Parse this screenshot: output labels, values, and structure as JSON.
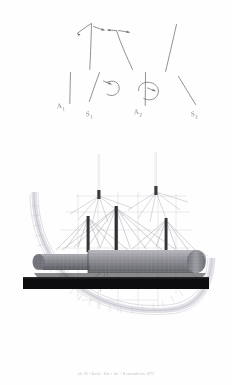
{
  "page": {
    "background_color": "#fefefe",
    "kind": "scanned-document-page"
  },
  "sketch": {
    "title_hidden": "hand-drawn force and moment vector diagram",
    "ink_color": "#5d5d63",
    "labels": [
      {
        "id": "a1",
        "base": "A",
        "sub": "1",
        "x": 57,
        "y": 105
      },
      {
        "id": "s1",
        "base": "S",
        "sub": "1",
        "x": 86,
        "y": 113
      },
      {
        "id": "a2",
        "base": "A",
        "sub": "2",
        "x": 137,
        "y": 112
      },
      {
        "id": "s2",
        "base": "S",
        "sub": "2",
        "x": 193,
        "y": 114
      }
    ]
  },
  "render": {
    "plan_view_name": "roof plan with radial cable net",
    "elevation_view_name": "elevation with three masts on plinth",
    "mast_color": "#3c3c40",
    "cable_color": "#a8a8ae",
    "grid_color": "#cfcfd6",
    "membrane_color": "#8e8e95",
    "plinth_color": "#0d0d0f",
    "mast_count_plan": 2,
    "mast_count_elevation": 3
  },
  "caption": {
    "text": "Ab 30 - Dach - Ent - der - Konstruktion 1972"
  }
}
